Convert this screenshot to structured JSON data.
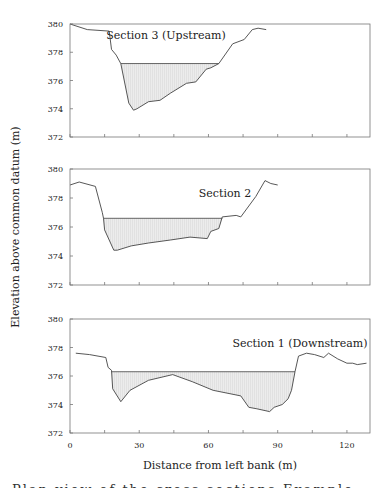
{
  "figure": {
    "y_axis_title": "Elevation above common datum (m)",
    "x_axis_title": "Distance from left bank (m)",
    "x_tick_labels": [
      "0",
      "30",
      "60",
      "90",
      "120"
    ],
    "y_tick_labels": [
      "380",
      "378",
      "376",
      "374",
      "372"
    ],
    "caption_fragment": "Plan   view  of  the  cross-sections  Example  study"
  },
  "colors": {
    "profile_line": "#444444",
    "water_fill": "#e8e8e8",
    "frame": "#777777"
  },
  "chart_data": [
    {
      "type": "area",
      "title": "Section 3 (Upstream)",
      "xlabel": "Distance from left bank (m)",
      "ylabel": "Elevation above common datum (m)",
      "xlim": [
        0,
        130
      ],
      "ylim": [
        372,
        380
      ],
      "x_ticks": [
        0,
        15,
        30,
        45,
        60,
        75,
        90,
        105,
        120
      ],
      "y_ticks": [
        372,
        374,
        376,
        378,
        380
      ],
      "grid": false,
      "water_surface": {
        "elevation": 377.2,
        "x_start": 22,
        "x_end": 64.5
      },
      "series": [
        {
          "name": "Bed profile",
          "x": [
            0,
            7.5,
            17,
            18,
            20,
            22,
            25.5,
            27.5,
            29,
            34,
            39,
            43.5,
            50.5,
            54.5,
            59,
            61,
            64.5,
            70.5,
            75.5,
            79,
            81.5,
            85
          ],
          "y": [
            380,
            379.6,
            379.5,
            378.2,
            377.8,
            377.2,
            374.4,
            373.9,
            374.0,
            374.5,
            374.6,
            375.1,
            375.8,
            375.9,
            376.8,
            376.9,
            377.2,
            378.6,
            378.9,
            379.6,
            379.7,
            379.6
          ]
        }
      ]
    },
    {
      "type": "area",
      "title": "Section 2",
      "xlabel": "Distance from left bank (m)",
      "ylabel": "Elevation above common datum (m)",
      "xlim": [
        0,
        130
      ],
      "ylim": [
        372,
        380
      ],
      "x_ticks": [
        0,
        15,
        30,
        45,
        60,
        75,
        90,
        105,
        120
      ],
      "y_ticks": [
        372,
        374,
        376,
        378,
        380
      ],
      "grid": false,
      "water_surface": {
        "elevation": 376.6,
        "x_start": 14.5,
        "x_end": 66
      },
      "series": [
        {
          "name": "Bed profile",
          "x": [
            0,
            4,
            11,
            14,
            14.5,
            15,
            19,
            20.5,
            26.5,
            34,
            43.5,
            52,
            59.5,
            61,
            64.5,
            66,
            72,
            74,
            80.5,
            84.5,
            87,
            90
          ],
          "y": [
            378.9,
            379.1,
            378.8,
            377.0,
            376.6,
            375.8,
            374.4,
            374.4,
            374.7,
            374.9,
            375.1,
            375.3,
            375.2,
            375.7,
            375.9,
            376.7,
            376.8,
            376.7,
            378.1,
            379.2,
            379.0,
            378.9
          ]
        }
      ]
    },
    {
      "type": "area",
      "title": "Section 1 (Downstream)",
      "xlabel": "Distance from left bank (m)",
      "ylabel": "Elevation above common datum (m)",
      "xlim": [
        0,
        130
      ],
      "ylim": [
        372,
        380
      ],
      "x_ticks": [
        0,
        15,
        30,
        45,
        60,
        75,
        90,
        105,
        120
      ],
      "x_tick_labels": [
        "0",
        "30",
        "60",
        "90",
        "120"
      ],
      "y_ticks": [
        372,
        374,
        376,
        378,
        380
      ],
      "grid": false,
      "water_surface": {
        "elevation": 376.3,
        "x_start": 18,
        "x_end": 97.5
      },
      "series": [
        {
          "name": "Bed profile",
          "x": [
            2.5,
            8.5,
            15.5,
            16.5,
            18,
            18.5,
            22,
            26,
            34,
            44.5,
            53,
            62,
            74,
            77.5,
            81,
            86.5,
            88.5,
            92,
            94.5,
            96,
            97.5,
            99,
            102.5,
            106,
            110,
            112,
            116,
            120,
            122.5,
            124.5,
            128.5
          ],
          "y": [
            377.6,
            377.5,
            377.3,
            376.6,
            376.4,
            375.1,
            374.2,
            375.0,
            375.7,
            376.1,
            375.6,
            375.0,
            374.6,
            373.8,
            373.7,
            373.5,
            373.8,
            374.0,
            374.4,
            375.0,
            376.3,
            377.4,
            377.6,
            377.5,
            377.3,
            377.6,
            377.2,
            376.9,
            376.9,
            376.8,
            376.9
          ]
        }
      ]
    }
  ]
}
